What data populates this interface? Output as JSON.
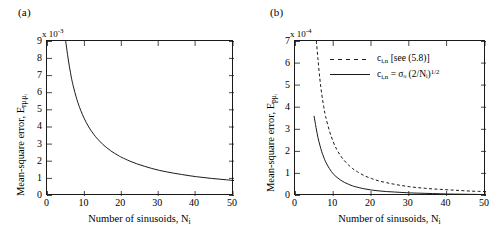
{
  "figure": {
    "background": "#ffffff",
    "line_color": "#1a1a1a"
  },
  "panels": [
    {
      "tag": "(a)",
      "exponent_prefix": "x 10",
      "exponent_power": "-3",
      "ylabel_main": "Mean-square error, E",
      "ylabel_sub": "r",
      "ylabel_sub2": "μᵢμᵢ",
      "xlabel_main": "Number of sinusoids, N",
      "xlabel_sub": "i",
      "ytick_labels": [
        "0",
        "1",
        "2",
        "3",
        "4",
        "5",
        "6",
        "7",
        "8",
        "9"
      ],
      "xtick_labels": [
        "0",
        "10",
        "20",
        "30",
        "40",
        "50"
      ],
      "legend": []
    },
    {
      "tag": "(b)",
      "exponent_prefix": "x 10",
      "exponent_power": "-4",
      "ylabel_main": "Mean-square error, E",
      "ylabel_sub": "p",
      "ylabel_sub2": "μᵢ",
      "xlabel_main": "Number of sinusoids, N",
      "xlabel_sub": "i",
      "ytick_labels": [
        "0",
        "1",
        "2",
        "3",
        "4",
        "5",
        "6",
        "7"
      ],
      "xtick_labels": [
        "0",
        "10",
        "20",
        "30",
        "40",
        "50"
      ],
      "legend": [
        {
          "style": "dashed",
          "text_a": "c",
          "text_sub": "i,n",
          "text_b": " [see (5.8)]"
        },
        {
          "style": "solid",
          "text_a": "c",
          "text_sub": "i,n",
          "text_b": " = σₒ (2/Nᵢ)",
          "text_sup": "1/2"
        }
      ]
    }
  ],
  "chart_data": [
    {
      "type": "line",
      "panel": "(a)",
      "title": "",
      "xlabel": "Number of sinusoids, Ni",
      "ylabel": "Mean-square error, Er_mui_mui",
      "y_exponent": -3,
      "xlim": [
        0,
        50
      ],
      "ylim": [
        0,
        9
      ],
      "xticks": [
        0,
        10,
        20,
        30,
        40,
        50
      ],
      "yticks": [
        0,
        1,
        2,
        3,
        4,
        5,
        6,
        7,
        8,
        9
      ],
      "grid": false,
      "legend_position": "none",
      "series": [
        {
          "name": "mean-square-error-curve",
          "style": "solid",
          "x": [
            5,
            5.5,
            6,
            6.5,
            7,
            8,
            9,
            10,
            11,
            12,
            13,
            14,
            15,
            16,
            17,
            18,
            19,
            20,
            22,
            24,
            26,
            28,
            30,
            32,
            34,
            36,
            38,
            40,
            42,
            44,
            46,
            48,
            50
          ],
          "y": [
            9.0,
            8.2,
            7.5,
            6.9,
            6.4,
            5.6,
            4.98,
            4.48,
            4.07,
            3.73,
            3.44,
            3.2,
            2.98,
            2.8,
            2.63,
            2.49,
            2.36,
            2.24,
            2.04,
            1.87,
            1.73,
            1.6,
            1.49,
            1.4,
            1.32,
            1.25,
            1.18,
            1.12,
            1.07,
            1.02,
            0.98,
            0.94,
            0.9
          ]
        }
      ]
    },
    {
      "type": "line",
      "panel": "(b)",
      "title": "",
      "xlabel": "Number of sinusoids, Ni",
      "ylabel": "Mean-square error, Ep_mui",
      "y_exponent": -4,
      "xlim": [
        0,
        50
      ],
      "ylim": [
        0,
        7
      ],
      "xticks": [
        0,
        10,
        20,
        30,
        40,
        50
      ],
      "yticks": [
        0,
        1,
        2,
        3,
        4,
        5,
        6,
        7
      ],
      "grid": false,
      "legend_position": "upper-right-inside",
      "series": [
        {
          "name": "c_i,n [see (5.8)]",
          "style": "dashed",
          "x": [
            5.6,
            6,
            6.5,
            7,
            7.5,
            8,
            9,
            10,
            11,
            12,
            13,
            14,
            15,
            16,
            18,
            20,
            22,
            24,
            26,
            28,
            30,
            32,
            34,
            36,
            38,
            40,
            42,
            44,
            46,
            48,
            50
          ],
          "y": [
            7.0,
            6.2,
            5.3,
            4.6,
            4.05,
            3.6,
            2.95,
            2.45,
            2.08,
            1.8,
            1.58,
            1.4,
            1.25,
            1.13,
            0.93,
            0.79,
            0.68,
            0.6,
            0.53,
            0.47,
            0.42,
            0.38,
            0.35,
            0.32,
            0.3,
            0.28,
            0.26,
            0.24,
            0.22,
            0.21,
            0.2
          ]
        },
        {
          "name": "c_i,n = sigma_o (2/Ni)^(1/2)",
          "style": "solid",
          "x": [
            5,
            5.5,
            6,
            6.5,
            7,
            7.5,
            8,
            9,
            10,
            11,
            12,
            13,
            14,
            15,
            16,
            18,
            20,
            22,
            24,
            26,
            28,
            30,
            32,
            34,
            36,
            38,
            40,
            42,
            44,
            46,
            48,
            50
          ],
          "y": [
            3.6,
            3.1,
            2.65,
            2.3,
            2.0,
            1.76,
            1.55,
            1.24,
            1.0,
            0.84,
            0.71,
            0.61,
            0.53,
            0.46,
            0.41,
            0.33,
            0.27,
            0.23,
            0.2,
            0.18,
            0.16,
            0.14,
            0.13,
            0.12,
            0.11,
            0.1,
            0.09,
            0.085,
            0.08,
            0.075,
            0.07,
            0.065
          ]
        }
      ]
    }
  ]
}
